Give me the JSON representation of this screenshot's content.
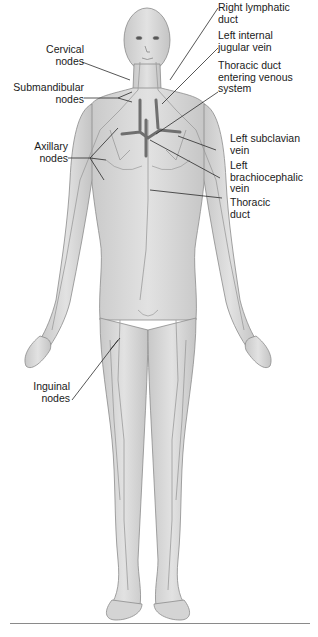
{
  "figure": {
    "colors": {
      "skin_fill": "#d6d6d6",
      "skin_outline": "#8c8c8c",
      "vessel": "#9a9a9a",
      "vein": "#6f6f6f",
      "leader_line": "#2b2b2b",
      "text": "#1a1a1a",
      "bottom_rule": "#8a8a8a"
    }
  },
  "labels": {
    "left": [
      {
        "id": "cervical-nodes",
        "text": "Cervical\nnodes"
      },
      {
        "id": "submandibular-nodes",
        "text": "Submandibular\nnodes"
      },
      {
        "id": "axillary-nodes",
        "text": "Axillary\nnodes"
      },
      {
        "id": "inguinal-nodes",
        "text": "Inguinal\nnodes"
      }
    ],
    "right": [
      {
        "id": "right-lymphatic-duct",
        "text": "Right lymphatic\nduct"
      },
      {
        "id": "left-internal-jugular-vein",
        "text": "Left internal\njugular vein"
      },
      {
        "id": "thoracic-duct-entering-venous-system",
        "text": "Thoracic duct\nentering venous\nsystem"
      },
      {
        "id": "left-subclavian-vein",
        "text": "Left subclavian\nvein"
      },
      {
        "id": "left-brachiocephalic-vein",
        "text": "Left\nbrachiocephalic\nvein"
      },
      {
        "id": "thoracic-duct",
        "text": "Thoracic\nduct"
      }
    ]
  }
}
